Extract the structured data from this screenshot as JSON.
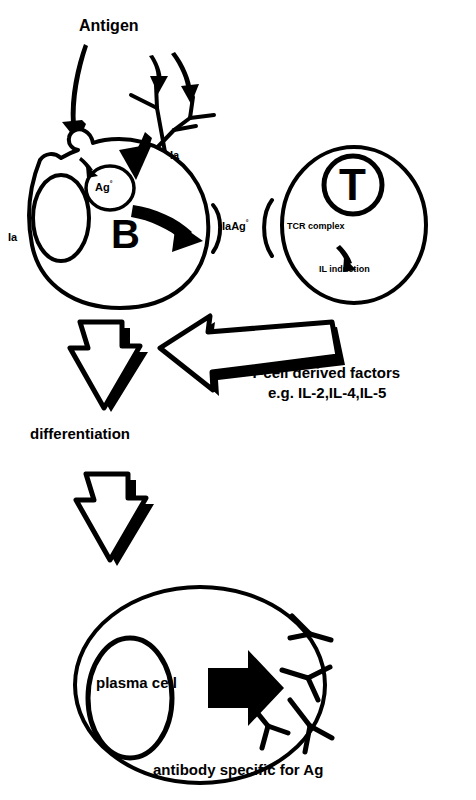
{
  "figure": {
    "background_color": "#ffffff",
    "stroke_color": "#000000"
  },
  "labels": {
    "antigen": "Antigen",
    "ia_top": "Ia",
    "ia_left": "Ia",
    "ag_processed": "Ag",
    "ag_processed_sup": "°",
    "b_cell": "B",
    "ia_ag": "IaAg",
    "ia_ag_sup": "°",
    "t_cell": "T",
    "tcr_complex": "TCR complex",
    "il_induction": "IL induction",
    "t_cell_factors_line1": "T-cell derived factors",
    "t_cell_factors_line2": "e.g. IL-2,IL-4,IL-5",
    "differentiation": "differentiation",
    "plasma_cell": "plasma cell",
    "antibody_caption": "antibody specific for Ag"
  },
  "icons": {
    "b_cell_membrane": "b-cell-circle-icon",
    "b_cell_nucleus": "nucleus-oval-icon",
    "ag_vesicle": "antigen-vesicle-icon",
    "t_cell_membrane": "t-cell-circle-icon",
    "t_receptor": "t-receptor-circle-icon",
    "plasma_cell_membrane": "plasma-cell-circle-icon",
    "plasma_cell_nucleus": "plasma-nucleus-oval-icon",
    "surface_antibody": "surface-antibody-y-icon",
    "secreted_antibody": "secreted-antibody-y-icon",
    "antigen_arrow": "antigen-curved-arrow-icon",
    "uptake_arrow": "antigen-uptake-arrow-icon",
    "presentation_arrow": "antigen-presentation-arrow-icon",
    "il_arrow": "il-induction-arrow-icon",
    "factors_arrow": "t-cell-factors-block-arrow-icon",
    "differentiation_arrow": "differentiation-block-arrow-icon",
    "secretion_arrow": "antibody-secretion-arrow-icon",
    "bracket_left": "ia-ag-left-bracket-icon",
    "bracket_right": "ia-ag-right-bracket-icon"
  }
}
